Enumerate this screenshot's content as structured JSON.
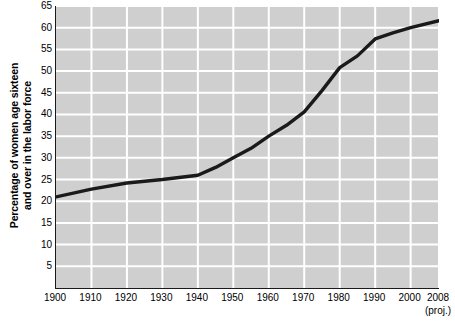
{
  "chart_data": {
    "type": "line",
    "title": "",
    "xlabel": "",
    "ylabel": "Percentage of women age sixteen and over in the labor force",
    "ylabel_line1": "Percentage of women age sixteen",
    "ylabel_line2": "and over in the labor force",
    "xlim": [
      1900,
      2008
    ],
    "ylim": [
      0,
      65
    ],
    "y_ticks": [
      5,
      10,
      15,
      20,
      25,
      30,
      35,
      40,
      45,
      50,
      55,
      60,
      65
    ],
    "x_ticks": [
      1900,
      1910,
      1920,
      1930,
      1940,
      1950,
      1960,
      1970,
      1980,
      1990,
      2000,
      2008
    ],
    "x_tick_labels": [
      "1900",
      "1910",
      "1920",
      "1930",
      "1940",
      "1950",
      "1960",
      "1970",
      "1980",
      "1990",
      "2000",
      "2008"
    ],
    "x_last_tick_note": "(proj.)",
    "grid": true,
    "grid_color": "#ffffff",
    "plot_background": "#cfcfcf",
    "line_color": "#1a1a1a",
    "axis_color": "#1a1a1a",
    "legend": "none",
    "legend_position": "none",
    "series": [
      {
        "name": "Percentage of women age sixteen and over in the labor force",
        "x": [
          1900,
          1910,
          1920,
          1930,
          1940,
          1945,
          1950,
          1955,
          1960,
          1965,
          1970,
          1975,
          1980,
          1985,
          1990,
          1995,
          2000,
          2008
        ],
        "values": [
          21.0,
          22.8,
          24.2,
          25.0,
          26.0,
          27.8,
          30.0,
          32.2,
          35.0,
          37.5,
          40.6,
          45.5,
          50.8,
          53.5,
          57.4,
          58.8,
          60.0,
          61.6
        ]
      }
    ]
  }
}
